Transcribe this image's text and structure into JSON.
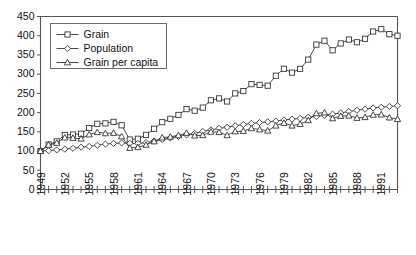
{
  "chart_data": {
    "type": "line",
    "title": "",
    "subtitle": "",
    "xlabel": "",
    "ylabel": "",
    "xlim": [
      1949,
      1993
    ],
    "ylim": [
      0,
      450
    ],
    "yticks": [
      0,
      50,
      100,
      150,
      200,
      250,
      300,
      350,
      400,
      450
    ],
    "ytick_labels": [
      "0",
      "50",
      "100",
      "150",
      "200",
      "250",
      "300",
      "350",
      "400",
      "450"
    ],
    "x": [
      1949,
      1950,
      1951,
      1952,
      1953,
      1954,
      1955,
      1956,
      1957,
      1958,
      1959,
      1960,
      1961,
      1962,
      1963,
      1964,
      1965,
      1966,
      1967,
      1968,
      1969,
      1970,
      1971,
      1972,
      1973,
      1974,
      1975,
      1976,
      1977,
      1978,
      1979,
      1980,
      1981,
      1982,
      1983,
      1984,
      1985,
      1986,
      1987,
      1988,
      1989,
      1990,
      1991,
      1992,
      1993
    ],
    "xtick_labels": [
      "1949",
      "1952",
      "1955",
      "1958",
      "1961",
      "1964",
      "1967",
      "1970",
      "1973",
      "1976",
      "1979",
      "1982",
      "1985",
      "1988",
      "1991"
    ],
    "xtick_label_years": [
      1949,
      1952,
      1955,
      1958,
      1961,
      1964,
      1967,
      1970,
      1973,
      1976,
      1979,
      1982,
      1985,
      1988,
      1991
    ],
    "xtick_every": 1,
    "xtick_label_every": 3,
    "grid": false,
    "legend_position": "upper-left",
    "series": [
      {
        "name": "Grain",
        "marker": "square",
        "values": [
          100,
          117,
          125,
          142,
          143,
          145,
          160,
          171,
          172,
          176,
          167,
          130,
          132,
          142,
          158,
          175,
          184,
          194,
          209,
          205,
          213,
          232,
          237,
          229,
          250,
          256,
          274,
          272,
          270,
          296,
          314,
          304,
          314,
          338,
          377,
          387,
          362,
          380,
          390,
          383,
          392,
          411,
          417,
          404,
          400
        ]
      },
      {
        "name": "Population",
        "marker": "diamond",
        "values": [
          100,
          101,
          103,
          105,
          107,
          110,
          112,
          115,
          118,
          120,
          121,
          120,
          120,
          122,
          126,
          130,
          134,
          138,
          142,
          146,
          151,
          155,
          159,
          162,
          166,
          169,
          172,
          174,
          176,
          178,
          181,
          183,
          185,
          188,
          190,
          193,
          196,
          199,
          203,
          206,
          209,
          212,
          214,
          216,
          218
        ]
      },
      {
        "name": "Grain per capita",
        "marker": "triangle",
        "values": [
          100,
          116,
          121,
          135,
          134,
          132,
          143,
          149,
          146,
          147,
          138,
          108,
          110,
          116,
          125,
          135,
          137,
          141,
          147,
          140,
          141,
          150,
          149,
          141,
          151,
          152,
          159,
          156,
          153,
          166,
          173,
          166,
          170,
          180,
          198,
          200,
          185,
          191,
          192,
          186,
          188,
          194,
          195,
          187,
          183
        ]
      }
    ]
  },
  "legend": {
    "items": [
      {
        "label": "Grain",
        "marker": "square"
      },
      {
        "label": "Population",
        "marker": "diamond"
      },
      {
        "label": "Grain per capita",
        "marker": "triangle"
      }
    ]
  },
  "colors": {
    "ink": "#2b2b2b",
    "axis": "#55545a",
    "background": "#ffffff"
  }
}
